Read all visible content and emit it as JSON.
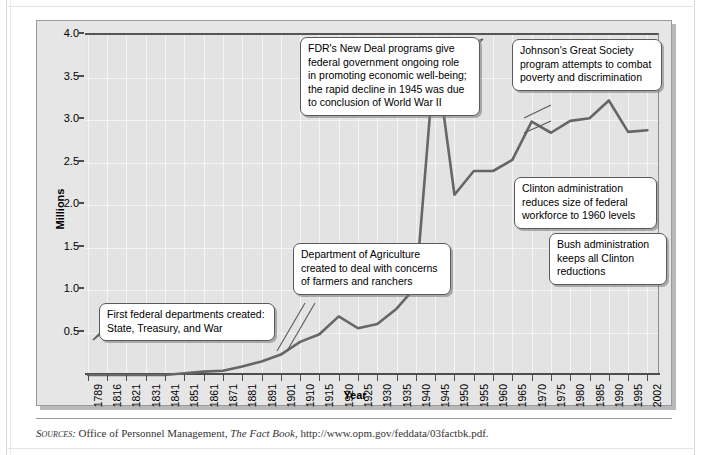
{
  "figure": {
    "source_label": "Sources:",
    "source_text_before": " Office of Personnel Management, ",
    "source_title": "The Fact Book",
    "source_text_after": ", http://www.opm.gov/feddata/03factbk.pdf."
  },
  "chart_data": {
    "type": "line",
    "title": "",
    "xlabel": "Year",
    "ylabel": "Millions",
    "ylim": [
      0,
      4.0
    ],
    "yticks": [
      "0.5",
      "1.0",
      "1.5",
      "2.0",
      "2.5",
      "3.0",
      "3.5",
      "4.0"
    ],
    "ytick_values": [
      0.5,
      1.0,
      1.5,
      2.0,
      2.5,
      3.0,
      3.5,
      4.0
    ],
    "grid": true,
    "legend": "none",
    "categories": [
      "1789",
      "1816",
      "1821",
      "1831",
      "1841",
      "1851",
      "1861",
      "1871",
      "1881",
      "1891",
      "1901",
      "1910",
      "1915",
      "1920",
      "1925",
      "1930",
      "1935",
      "1940",
      "1945",
      "1950",
      "1955",
      "1960",
      "1965",
      "1970",
      "1975",
      "1980",
      "1985",
      "1990",
      "1995",
      "2002"
    ],
    "series": [
      {
        "name": "Federal civilian employment",
        "values": [
          0.001,
          0.005,
          0.007,
          0.012,
          0.019,
          0.027,
          0.037,
          0.053,
          0.1,
          0.16,
          0.24,
          0.39,
          0.48,
          0.69,
          0.55,
          0.6,
          0.78,
          1.04,
          3.82,
          2.12,
          2.4,
          2.4,
          2.53,
          2.98,
          2.85,
          2.99,
          3.02,
          3.23,
          2.86,
          2.69
        ],
        "display_values": [
          0.0,
          0.0,
          0.0,
          0.0,
          0.0,
          0.02,
          0.04,
          0.05,
          0.1,
          0.16,
          0.24,
          0.39,
          0.48,
          0.69,
          0.55,
          0.6,
          0.78,
          1.04,
          3.82,
          2.12,
          2.4,
          2.4,
          2.53,
          2.98,
          2.85,
          2.99,
          3.02,
          3.23,
          2.86,
          2.88
        ]
      }
    ],
    "line_color": "#666666",
    "plot_background": "#e3e3e3",
    "gridline_color": "#f4f4f4",
    "annotations": [
      {
        "id": "first-departments",
        "text": "First federal departments created:\nState, Treasury, and War",
        "line1": "First federal departments created:",
        "line2": "State, Treasury, and War",
        "points_to_year": "1789"
      },
      {
        "id": "dept-agriculture",
        "text": "Department of Agriculture created to deal with concerns of farmers and ranchers",
        "line1": "Department of Agriculture",
        "line2": "created to deal with concerns",
        "line3": "of farmers and ranchers",
        "points_to_year": "1862"
      },
      {
        "id": "fdr-new-deal",
        "text": "FDR's New Deal programs give federal government ongoing role in promoting economic well-being; the rapid decline in 1945 was due to conclusion of World War II",
        "line1": "FDR's New Deal programs give",
        "line2": "federal government ongoing role",
        "line3": "in promoting economic well-being;",
        "line4": "the rapid decline in 1945 was due",
        "line5": "to conclusion of World War II",
        "points_to_year": "1945"
      },
      {
        "id": "great-society",
        "text": "Johnson's Great Society program attempts to combat poverty and discrimination",
        "line1": "Johnson's Great Society",
        "line2": "program attempts to combat",
        "line3": "poverty and discrimination",
        "points_to_year": "1970"
      },
      {
        "id": "clinton-reduction",
        "text": "Clinton administration reduces size of federal workforce to 1960 levels",
        "line1": "Clinton administration",
        "line2": "reduces size of federal",
        "line3": "workforce to 1960 levels",
        "points_to_year": "1995"
      },
      {
        "id": "bush-keeps",
        "text": "Bush administration keeps all Clinton reductions",
        "line1": "Bush administration",
        "line2": "keeps all Clinton",
        "line3": "reductions",
        "points_to_year": "2002"
      }
    ]
  }
}
